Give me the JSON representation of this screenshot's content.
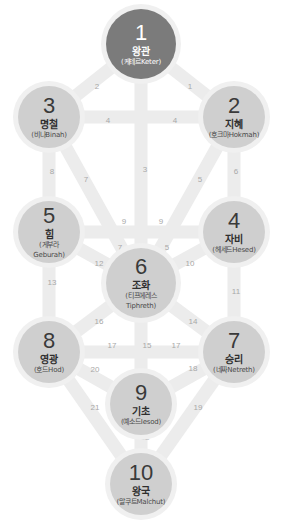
{
  "colors": {
    "path": "#ececec",
    "path_number": "#a8a8a8",
    "node_light": "#cfcfcf",
    "node_dark": "#7b7b7b",
    "halo": "#f0f0f0"
  },
  "nodes": [
    {
      "id": 1,
      "num": "1",
      "name": "왕관",
      "sub": "(케테르Keter)",
      "cx": 141,
      "cy": 44,
      "r": 35,
      "dark": true
    },
    {
      "id": 2,
      "num": "2",
      "name": "지혜",
      "sub": "(호크마Hokmah)",
      "cx": 234,
      "cy": 117,
      "r": 31,
      "dark": false
    },
    {
      "id": 3,
      "num": "3",
      "name": "명철",
      "sub": "(비나Binah)",
      "cx": 49,
      "cy": 117,
      "r": 31,
      "dark": false
    },
    {
      "id": 4,
      "num": "4",
      "name": "자비",
      "sub": "(헤세드Hesed)",
      "cx": 234,
      "cy": 232,
      "r": 31,
      "dark": false
    },
    {
      "id": 5,
      "num": "5",
      "name": "힘",
      "sub": "(게부라\nGeburah)",
      "cx": 49,
      "cy": 232,
      "r": 31,
      "dark": false
    },
    {
      "id": 6,
      "num": "6",
      "name": "조화",
      "sub": "(티프에레스\nTiphreth)",
      "cx": 141,
      "cy": 283,
      "r": 35,
      "dark": false
    },
    {
      "id": 7,
      "num": "7",
      "name": "승리",
      "sub": "(네짜Netreth)",
      "cx": 234,
      "cy": 352,
      "r": 31,
      "dark": false
    },
    {
      "id": 8,
      "num": "8",
      "name": "영광",
      "sub": "(호드Hod)",
      "cx": 49,
      "cy": 352,
      "r": 31,
      "dark": false
    },
    {
      "id": 9,
      "num": "9",
      "name": "기초",
      "sub": "(예소드Iesod)",
      "cx": 141,
      "cy": 404,
      "r": 31,
      "dark": false
    },
    {
      "id": 10,
      "num": "10",
      "name": "왕국",
      "sub": "(말쿠트Malchut)",
      "cx": 141,
      "cy": 484,
      "r": 31,
      "dark": false
    }
  ],
  "paths": [
    {
      "from": 1,
      "to": 2,
      "label": "1",
      "lx": 190,
      "ly": 87
    },
    {
      "from": 1,
      "to": 3,
      "label": "2",
      "lx": 97,
      "ly": 87
    },
    {
      "from": 1,
      "to": 6,
      "label": "3",
      "lx": 145,
      "ly": 170
    },
    {
      "from": 3,
      "to": 2,
      "label": "4",
      "lx": 108,
      "ly": 121
    },
    {
      "from": 3,
      "to": 2,
      "label": "4",
      "lx": 175,
      "ly": 121
    },
    {
      "from": 2,
      "to": 6,
      "label": "5",
      "lx": 200,
      "ly": 180
    },
    {
      "from": 2,
      "to": 4,
      "label": "6",
      "lx": 236,
      "ly": 172
    },
    {
      "from": 3,
      "to": 6,
      "label": "7",
      "lx": 86,
      "ly": 180
    },
    {
      "from": 3,
      "to": 5,
      "label": "8",
      "lx": 52,
      "ly": 172
    },
    {
      "from": 5,
      "to": 4,
      "label": "9",
      "lx": 124,
      "ly": 222
    },
    {
      "from": 5,
      "to": 4,
      "label": "9",
      "lx": 161,
      "ly": 222
    },
    {
      "from": 4,
      "to": 6,
      "label": "10",
      "lx": 190,
      "ly": 264
    },
    {
      "from": 4,
      "to": 7,
      "label": "11",
      "lx": 236,
      "ly": 292
    },
    {
      "from": 5,
      "to": 6,
      "label": "12",
      "lx": 99,
      "ly": 264
    },
    {
      "from": 5,
      "to": 8,
      "label": "13",
      "lx": 52,
      "ly": 283
    },
    {
      "from": 6,
      "to": 7,
      "label": "14",
      "lx": 193,
      "ly": 322
    },
    {
      "from": 6,
      "to": 9,
      "label": "15",
      "lx": 147,
      "ly": 346
    },
    {
      "from": 8,
      "to": 6,
      "label": "16",
      "lx": 99,
      "ly": 322
    },
    {
      "from": 8,
      "to": 7,
      "label": "17",
      "lx": 112,
      "ly": 346
    },
    {
      "from": 8,
      "to": 7,
      "label": "17",
      "lx": 176,
      "ly": 346
    },
    {
      "from": 7,
      "to": 9,
      "label": "18",
      "lx": 193,
      "ly": 369
    },
    {
      "from": 7,
      "to": 10,
      "label": "19",
      "lx": 198,
      "ly": 408
    },
    {
      "from": 8,
      "to": 9,
      "label": "20",
      "lx": 95,
      "ly": 370
    },
    {
      "from": 8,
      "to": 10,
      "label": "21",
      "lx": 95,
      "ly": 408
    },
    {
      "from": 9,
      "to": 10,
      "label": "22",
      "lx": 145,
      "ly": 438
    },
    {
      "from": 3,
      "to": 6,
      "label": "7",
      "lx": 120,
      "ly": 248
    },
    {
      "from": 2,
      "to": 6,
      "label": "5",
      "lx": 167,
      "ly": 248
    }
  ]
}
